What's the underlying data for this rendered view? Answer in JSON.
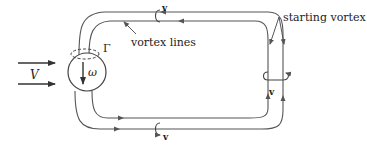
{
  "diagram": {
    "labels": {
      "freestream": "V",
      "vorticity": "ω",
      "circulation": "Γ",
      "vortex_lines": "vortex lines",
      "starting_vortex": "starting vortex",
      "velocity_top": "v",
      "velocity_bottom": "v",
      "velocity_right": "v"
    },
    "colors": {
      "line": "#555555",
      "text": "#222222",
      "background": "#ffffff"
    }
  }
}
